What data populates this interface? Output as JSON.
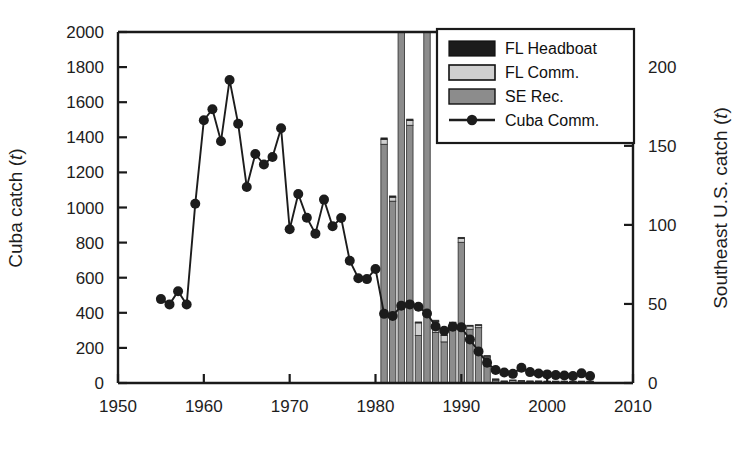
{
  "chart_data": {
    "type": "bar",
    "title": "",
    "subtitle": "",
    "xlabel": "",
    "ylabel": "Cuba catch (t)",
    "ylabel_right": "Southeast U.S. catch (t)",
    "xlim": [
      1950,
      2010
    ],
    "ylim": [
      0,
      2000
    ],
    "ylim_right": [
      0,
      222
    ],
    "xticks": [
      1950,
      1960,
      1970,
      1980,
      1990,
      2000,
      2010
    ],
    "yticks": [
      0,
      200,
      400,
      600,
      800,
      1000,
      1200,
      1400,
      1600,
      1800,
      2000
    ],
    "yticks_right": [
      0,
      50,
      100,
      150,
      200
    ],
    "grid": false,
    "legend_position": "top-right",
    "legend": [
      "FL Headboat",
      "FL Comm.",
      "SE Rec.",
      "Cuba Comm."
    ],
    "colors": {
      "fl_headboat": "#1c1c1c",
      "fl_comm": "#d0d0d0",
      "se_rec": "#8c8c8c",
      "cuba_comm": "#1c1c1c",
      "axis": "#1a1a1a",
      "background": "#ffffff"
    },
    "series": [
      {
        "name": "Cuba Comm.",
        "axis": "left",
        "type": "line",
        "marker": "filled-circle",
        "x": [
          1955,
          1956,
          1957,
          1958,
          1959,
          1960,
          1961,
          1962,
          1963,
          1964,
          1965,
          1966,
          1967,
          1968,
          1969,
          1970,
          1971,
          1972,
          1973,
          1974,
          1975,
          1976,
          1977,
          1978,
          1979,
          1980,
          1981,
          1982,
          1983,
          1984,
          1985,
          1986,
          1987,
          1988,
          1989,
          1990,
          1991,
          1992,
          1993,
          1994,
          1995,
          1996,
          1997,
          1998,
          1999,
          2000,
          2001,
          2002,
          2003,
          2004,
          2005
        ],
        "y": [
          478,
          448,
          523,
          447,
          1021,
          1497,
          1560,
          1378,
          1727,
          1477,
          1117,
          1305,
          1245,
          1288,
          1452,
          876,
          1077,
          942,
          851,
          1045,
          893,
          940,
          697,
          597,
          592,
          650,
          394,
          382,
          440,
          448,
          434,
          396,
          322,
          298,
          321,
          317,
          248,
          180,
          115,
          74,
          60,
          52,
          87,
          62,
          54,
          49,
          45,
          43,
          40,
          55,
          40
        ]
      },
      {
        "name": "FL Headboat",
        "axis": "right",
        "type": "bar-stacked",
        "x": [
          1981,
          1982,
          1983,
          1984,
          1985,
          1986,
          1987,
          1988,
          1989,
          1990,
          1991,
          1992,
          1993,
          1994,
          1995,
          1996,
          1997,
          1998,
          1999,
          2000,
          2001,
          2002,
          2003,
          2004,
          2005
        ],
        "y": [
          1.0,
          0.8,
          0.7,
          0.9,
          0.6,
          0.8,
          0.7,
          0.6,
          0.5,
          0.6,
          0.5,
          0.4,
          0.3,
          0.3,
          0.2,
          0.2,
          0.2,
          0.2,
          0.2,
          0.2,
          0.2,
          0.2,
          0.2,
          0.2,
          0.2
        ]
      },
      {
        "name": "FL Comm.",
        "axis": "right",
        "type": "bar-stacked",
        "x": [
          1981,
          1982,
          1983,
          1984,
          1985,
          1986,
          1987,
          1988,
          1989,
          1990,
          1991,
          1992,
          1993,
          1994,
          1995,
          1996,
          1997,
          1998,
          1999,
          2000,
          2001,
          2002,
          2003,
          2004,
          2005
        ],
        "y": [
          3.0,
          2.5,
          2.5,
          3.0,
          8.0,
          2.5,
          7.0,
          4.0,
          3.0,
          2.5,
          2.0,
          1.5,
          1.0,
          0.8,
          0.6,
          1.2,
          0.8,
          0.6,
          0.6,
          0.5,
          0.5,
          0.5,
          0.5,
          0.5,
          0.5
        ]
      },
      {
        "name": "SE Rec.",
        "axis": "right",
        "type": "bar-stacked",
        "x": [
          1981,
          1982,
          1983,
          1984,
          1985,
          1986,
          1987,
          1988,
          1989,
          1990,
          1991,
          1992,
          1993,
          1994,
          1995,
          1996,
          1997,
          1998,
          1999,
          2000,
          2001,
          2002,
          2003,
          2004,
          2005
        ],
        "y": [
          151,
          115,
          227,
          163,
          30,
          222,
          32,
          26,
          35,
          89,
          34,
          35,
          16,
          1.5,
          0.5,
          0.5,
          0.5,
          0.5,
          0.5,
          0.5,
          0.5,
          0.5,
          0.5,
          0.5,
          0.5
        ]
      }
    ],
    "totals_right_axis": {
      "1981": 155,
      "1982": 118,
      "1983": 230,
      "1984": 167,
      "1985": 39,
      "1986": 225,
      "1987": 40,
      "1988": 31,
      "1989": 39,
      "1990": 92,
      "1991": 37,
      "1992": 37,
      "1993": 17,
      "1994": 2.6,
      "1995": 1.3,
      "1996": 1.9,
      "1997": 1.5,
      "1998": 1.3,
      "1999": 1.3,
      "2000": 1.2,
      "2001": 1.2,
      "2002": 1.2,
      "2003": 1.2,
      "2004": 1.2,
      "2005": 1.2
    }
  }
}
